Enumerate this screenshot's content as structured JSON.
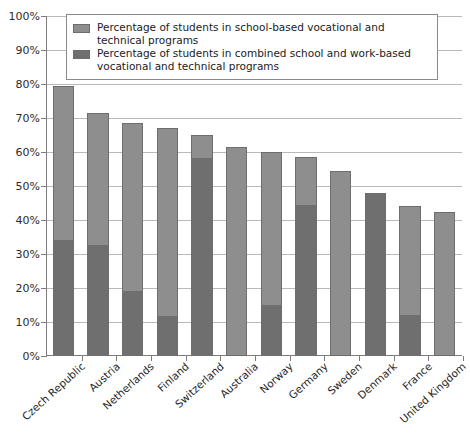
{
  "chart_data": {
    "type": "bar",
    "stacked": true,
    "title": "",
    "xlabel": "",
    "ylabel": "",
    "ylim": [
      0,
      100
    ],
    "ytick_labels": [
      "0%",
      "10%",
      "20%",
      "30%",
      "40%",
      "50%",
      "60%",
      "70%",
      "80%",
      "90%",
      "100%"
    ],
    "ytick_values": [
      0,
      10,
      20,
      30,
      40,
      50,
      60,
      70,
      80,
      90,
      100
    ],
    "grid": true,
    "legend_position": "top",
    "categories": [
      "Czech Republic",
      "Austria",
      "Netherlands",
      "Finland",
      "Switzerland",
      "Australia",
      "Norway",
      "Germany",
      "Sweden",
      "Denmark",
      "France",
      "United Kingdom"
    ],
    "series": [
      {
        "name": "Percentage of students in combined school and work-based vocational and technical programs",
        "key": "combined",
        "color": "#6f6f6f",
        "values": [
          34.0,
          32.5,
          19.0,
          11.5,
          58.5,
          0.0,
          15.0,
          44.5,
          0.0,
          48.0,
          12.0,
          0.0
        ]
      },
      {
        "name": "Percentage of students in school-based vocational and technical programs",
        "key": "school_based",
        "color": "#8e8e8e",
        "values": [
          45.5,
          39.0,
          49.5,
          55.5,
          6.5,
          61.5,
          45.0,
          14.0,
          54.5,
          0.0,
          32.0,
          42.5
        ]
      }
    ],
    "totals": [
      79.5,
      71.5,
      68.5,
      67.0,
      65.0,
      61.5,
      60.0,
      58.5,
      54.5,
      48.0,
      44.0,
      42.5
    ]
  },
  "legend": {
    "items": [
      {
        "swatch": "light",
        "label": "Percentage of students in school-based vocational and technical programs"
      },
      {
        "swatch": "dark",
        "label": "Percentage of students in combined school and work-based vocational and technical programs"
      }
    ]
  }
}
